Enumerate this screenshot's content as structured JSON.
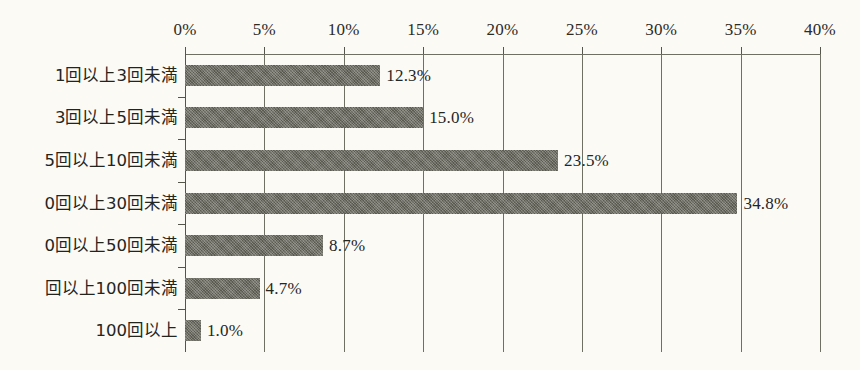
{
  "chart_data": {
    "type": "bar",
    "orientation": "horizontal",
    "title": "",
    "subtitle": "",
    "xlabel": "",
    "ylabel": "",
    "xlim": [
      0,
      40
    ],
    "xtick_step": 5,
    "grid": true,
    "legend": false,
    "legend_position": "none",
    "unit": "%",
    "categories": [
      "1回以上3回未満",
      "3回以上5回未満",
      "5回以上10回未満",
      "0回以上30回未満",
      "0回以上50回未満",
      "回以上100回未満",
      "100回以上"
    ],
    "values": [
      12.3,
      15.0,
      23.5,
      34.8,
      8.7,
      4.7,
      1.0
    ],
    "value_labels": [
      "12.3%",
      "15.0%",
      "23.5%",
      "34.8%",
      "8.7%",
      "4.7%",
      "1.0%"
    ],
    "xticks": [
      0,
      5,
      10,
      15,
      20,
      25,
      30,
      35,
      40
    ],
    "xtick_labels": [
      "0%",
      "5%",
      "10%",
      "15%",
      "20%",
      "25%",
      "30%",
      "35%",
      "40%"
    ]
  },
  "style": {
    "background_color": "#fbfaf5",
    "bar_color": "#6a6a60",
    "axis_color": "#6f6f63",
    "text_color": "#24241e"
  }
}
